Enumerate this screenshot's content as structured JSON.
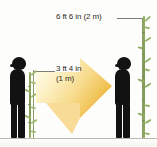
{
  "figure": {
    "title_visible": false,
    "background_color": "#fdfdfb",
    "ground_color": "#b9b7ae"
  },
  "labels": {
    "tall_measure": "6 ft 6 in (2 m)",
    "short_measure_line1": "3 ft 4 in",
    "short_measure_line2": "(1 m)"
  },
  "captions": {
    "left": "",
    "right": ""
  },
  "colors": {
    "arrow_light": "#fdf6d8",
    "arrow_dark": "#f0c14b",
    "bamboo_green": "#8fa95f",
    "post_green": "#8d9a63",
    "silhouette": "#121212",
    "leader": "#7d7d72"
  },
  "elements": {
    "left_person_name": "child-silhouette-left",
    "right_person_name": "child-silhouette-right",
    "left_plant_name": "bamboo-short",
    "right_plant_name": "bamboo-tall",
    "arrow_name": "growth-arrow"
  }
}
